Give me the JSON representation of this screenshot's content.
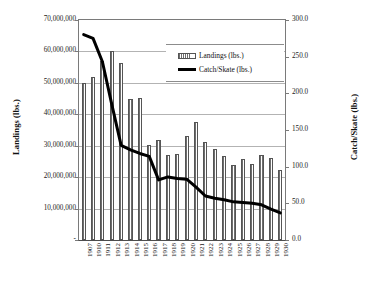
{
  "chart_data": {
    "type": "bar",
    "title": "",
    "subtitle": "",
    "xlabel": "",
    "ylabel": "Landings (lbs.)",
    "y2label": "Catch/Skate (lbs.)",
    "grid": true,
    "legend_position": "top-right",
    "categories": [
      "1907",
      "1910",
      "1911",
      "1912",
      "1913",
      "1914",
      "1915",
      "1916",
      "1917",
      "1918",
      "1919",
      "1920",
      "1921",
      "1922",
      "1923",
      "1924",
      "1925",
      "1926",
      "1927",
      "1928",
      "1929",
      "1930"
    ],
    "ylim": [
      0,
      70000000
    ],
    "yticks": [
      0,
      10000000,
      20000000,
      30000000,
      40000000,
      50000000,
      60000000,
      70000000
    ],
    "ytick_labels": [
      "-",
      "10,000,000",
      "20,000,000",
      "30,000,000",
      "40,000,000",
      "50,000,000",
      "60,000,000",
      "70,000,000"
    ],
    "y2lim": [
      0,
      300
    ],
    "y2ticks": [
      0,
      50,
      100,
      150,
      200,
      250,
      300
    ],
    "y2tick_labels": [
      "0.0",
      "50.0",
      "100.0",
      "150.0",
      "200.0",
      "250.0",
      "300.0"
    ],
    "series": [
      {
        "name": "Landings (lbs.)",
        "type": "bar",
        "axis": "left",
        "color": "#6e6e6e",
        "values": [
          50000000,
          51800000,
          57000000,
          60300000,
          56300000,
          45000000,
          45200000,
          30100000,
          31700000,
          27200000,
          27300000,
          33200000,
          37600000,
          31200000,
          28900000,
          26800000,
          23800000,
          25800000,
          24300000,
          27200000,
          26200000,
          22400000
        ]
      },
      {
        "name": "Catch/Skate (lbs.)",
        "type": "line",
        "axis": "right",
        "color": "#000000",
        "values": [
          280.0,
          275.0,
          243.0,
          185.0,
          129.0,
          123.0,
          118.0,
          114.0,
          82.0,
          86.0,
          84.0,
          83.0,
          72.0,
          60.0,
          57.0,
          55.0,
          52.0,
          51.0,
          50.0,
          48.0,
          42.0,
          37.0
        ]
      }
    ]
  },
  "legend": {
    "items": [
      {
        "label": "Landings (lbs.)",
        "marker": "bar-swatch"
      },
      {
        "label": "Catch/Skate (lbs.)",
        "marker": "line-swatch"
      }
    ]
  }
}
